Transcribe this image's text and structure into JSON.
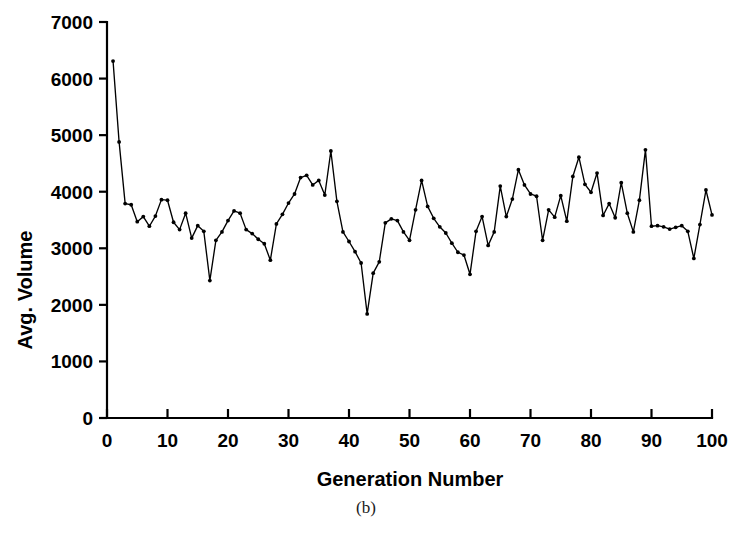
{
  "caption": "(b)",
  "chart_data": {
    "type": "line",
    "title": "",
    "xlabel": "Generation Number",
    "ylabel": "Avg. Volume",
    "xlim": [
      0,
      100
    ],
    "ylim": [
      0,
      7000
    ],
    "xticks": [
      0,
      10,
      20,
      30,
      40,
      50,
      60,
      70,
      80,
      90,
      100
    ],
    "yticks": [
      0,
      1000,
      2000,
      3000,
      4000,
      5000,
      6000,
      7000
    ],
    "xtick_labels": [
      "0",
      "10",
      "20",
      "30",
      "40",
      "50",
      "60",
      "70",
      "80",
      "90",
      "100"
    ],
    "ytick_labels": [
      "0",
      "1000",
      "2000",
      "3000",
      "4000",
      "5000",
      "6000",
      "7000"
    ],
    "grid": false,
    "legend": false,
    "marker": "filled-circle",
    "line_color": "#000000",
    "series": [
      {
        "name": "Avg. Volume",
        "x": [
          1,
          2,
          3,
          4,
          5,
          6,
          7,
          8,
          9,
          10,
          11,
          12,
          13,
          14,
          15,
          16,
          17,
          18,
          19,
          20,
          21,
          22,
          23,
          24,
          25,
          26,
          27,
          28,
          29,
          30,
          31,
          32,
          33,
          34,
          35,
          36,
          37,
          38,
          39,
          40,
          41,
          42,
          43,
          44,
          45,
          46,
          47,
          48,
          49,
          50,
          51,
          52,
          53,
          54,
          55,
          56,
          57,
          58,
          59,
          60,
          61,
          62,
          63,
          64,
          65,
          66,
          67,
          68,
          69,
          70,
          71,
          72,
          73,
          74,
          75,
          76,
          77,
          78,
          79,
          80,
          81,
          82,
          83,
          84,
          85,
          86,
          87,
          88,
          89,
          90,
          91,
          92,
          93,
          94,
          95,
          96,
          97,
          98,
          99,
          100
        ],
        "values": [
          6310,
          4880,
          3790,
          3770,
          3470,
          3560,
          3390,
          3570,
          3860,
          3850,
          3460,
          3330,
          3620,
          3180,
          3400,
          3300,
          2430,
          3140,
          3290,
          3490,
          3660,
          3620,
          3330,
          3260,
          3160,
          3080,
          2790,
          3430,
          3600,
          3800,
          3960,
          4250,
          4290,
          4120,
          4200,
          3940,
          4720,
          3830,
          3290,
          3120,
          2940,
          2740,
          1840,
          2560,
          2760,
          3450,
          3520,
          3490,
          3290,
          3140,
          3680,
          4200,
          3740,
          3530,
          3380,
          3270,
          3090,
          2930,
          2880,
          2540,
          3300,
          3560,
          3050,
          3290,
          4100,
          3560,
          3870,
          4390,
          4120,
          3960,
          3920,
          3140,
          3680,
          3550,
          3930,
          3480,
          4270,
          4610,
          4130,
          3990,
          4330,
          3580,
          3790,
          3540,
          4160,
          3620,
          3290,
          3850,
          4740,
          3390,
          3400,
          3380,
          3340,
          3370,
          3400,
          3300,
          2820,
          3420,
          4030,
          3590
        ]
      }
    ]
  }
}
